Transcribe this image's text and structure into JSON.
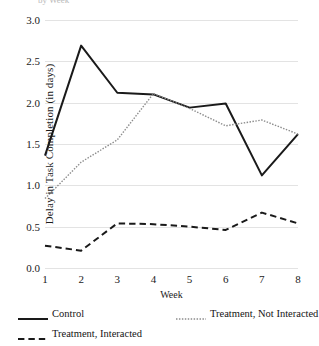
{
  "figure": {
    "title_fragment": "by Week",
    "background": "#ffffff"
  },
  "chart_data": {
    "type": "line",
    "title": "",
    "xlabel": "Week",
    "ylabel": "Delay in Task Completion (in days)",
    "categories": [
      "1",
      "2",
      "3",
      "4",
      "5",
      "6",
      "7",
      "8"
    ],
    "x": [
      1,
      2,
      3,
      4,
      5,
      6,
      7,
      8
    ],
    "ylim": [
      0.0,
      3.0
    ],
    "yticks": [
      "0.0",
      "0.5",
      "1.0",
      "1.5",
      "2.0",
      "2.5",
      "3.0"
    ],
    "ytick_values": [
      0.0,
      0.5,
      1.0,
      1.5,
      2.0,
      2.5,
      3.0
    ],
    "grid": true,
    "grid_axis": "y",
    "grid_color": "#e3e3e3",
    "legend_position": "bottom",
    "series": [
      {
        "name": "Control",
        "style": "solid",
        "color": "#1a1a1a",
        "width": 2.0,
        "values": [
          1.36,
          2.69,
          2.12,
          2.1,
          1.94,
          1.99,
          1.12,
          1.62
        ]
      },
      {
        "name": "Treatment, Not Interacted",
        "style": "dotted",
        "color": "#8c8c8c",
        "width": 1.4,
        "values": [
          0.84,
          1.28,
          1.55,
          2.11,
          1.93,
          1.72,
          1.79,
          1.62
        ]
      },
      {
        "name": "Treatment, Interacted",
        "style": "dashed",
        "color": "#1a1a1a",
        "width": 2.0,
        "values": [
          0.27,
          0.21,
          0.54,
          0.53,
          0.5,
          0.46,
          0.67,
          0.54
        ]
      }
    ]
  }
}
